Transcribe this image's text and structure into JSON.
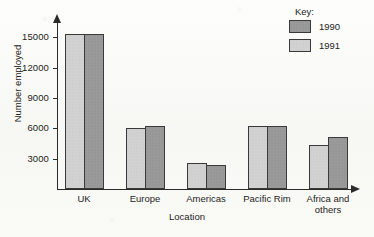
{
  "chart_data": {
    "type": "bar",
    "title": "",
    "xlabel": "Location",
    "ylabel": "Number employed",
    "categories": [
      "UK",
      "Europe",
      "Americas",
      "Pacific Rim",
      "Africa and others"
    ],
    "series": [
      {
        "name": "1990",
        "color": "#9a9a9a",
        "values": [
          15300,
          6200,
          2400,
          6250,
          5100
        ]
      },
      {
        "name": "1991",
        "color": "#d2d2d2",
        "values": [
          15300,
          6050,
          2600,
          6250,
          4300
        ]
      }
    ],
    "bar_order_in_group": [
      "1991",
      "1990"
    ],
    "ylim": [
      0,
      16500
    ],
    "yticks": [
      3000,
      6000,
      9000,
      12000,
      15000
    ],
    "ytick_labels": [
      "3000",
      "6000",
      "9000",
      "12000",
      "15000"
    ],
    "grid": false,
    "legend": {
      "title": "Key:",
      "position": "top-right",
      "entries": [
        "1990",
        "1991"
      ]
    }
  },
  "legend": {
    "title": "Key:",
    "items": [
      {
        "label": "1990",
        "series": "1990"
      },
      {
        "label": "1991",
        "series": "1991"
      }
    ]
  },
  "axes": {
    "y_title": "Number employed",
    "x_title": "Location"
  }
}
